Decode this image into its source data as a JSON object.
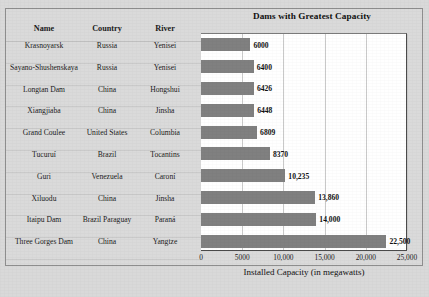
{
  "chart_data": {
    "type": "bar",
    "orientation": "horizontal",
    "title": "Dams with Greatest Capacity",
    "xlabel": "Installed Capacity (in megawatts)",
    "ylabel": "",
    "xlim": [
      0,
      25000
    ],
    "xticks": [
      0,
      5000,
      10000,
      15000,
      20000,
      25000
    ],
    "xtick_labels": [
      "0",
      "5000",
      "10,000",
      "15,000",
      "20,000",
      "25,000"
    ],
    "grid": true,
    "legend": "none",
    "bar_color": "#808080",
    "categories": [
      "Krasnoyarsk",
      "Sayano-Shushenskaya",
      "Longtan Dam",
      "Xiangjiaba",
      "Grand Coulee",
      "Tucuruí",
      "Guri",
      "Xiluodu",
      "Itaipu Dam",
      "Three Gorges Dam"
    ],
    "values": [
      6000,
      6400,
      6426,
      6448,
      6809,
      8370,
      10235,
      13860,
      14000,
      22500
    ],
    "data_labels": [
      "6000",
      "6400",
      "6426",
      "6448",
      "6809",
      "8370",
      "10,235",
      "13,860",
      "14,000",
      "22,500"
    ]
  },
  "table": {
    "columns": [
      "Name",
      "Country",
      "River"
    ],
    "rows": [
      {
        "name": "Krasnoyarsk",
        "country": "Russia",
        "river": "Yenisei"
      },
      {
        "name": "Sayano-Shushenskaya",
        "country": "Russia",
        "river": "Yenisei"
      },
      {
        "name": "Longtan Dam",
        "country": "China",
        "river": "Hongshui"
      },
      {
        "name": "Xiangjiaba",
        "country": "China",
        "river": "Jinsha"
      },
      {
        "name": "Grand Coulee",
        "country": "United States",
        "river": "Columbia"
      },
      {
        "name": "Tucuruí",
        "country": "Brazil",
        "river": "Tocantins"
      },
      {
        "name": "Guri",
        "country": "Venezuela",
        "river": "Caroní"
      },
      {
        "name": "Xiluodu",
        "country": "China",
        "river": "Jinsha"
      },
      {
        "name": "Itaipu Dam",
        "country": "Brazil Paraguay",
        "river": "Paraná"
      },
      {
        "name": "Three Gorges Dam",
        "country": "China",
        "river": "Yangtze"
      }
    ]
  }
}
